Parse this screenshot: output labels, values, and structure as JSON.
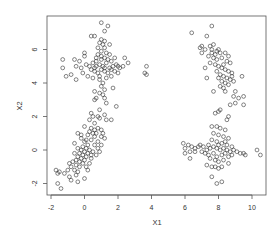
{
  "chart_data": {
    "type": "scatter",
    "title": "",
    "xlabel": "X1",
    "ylabel": "X2",
    "xlim": [
      -2.2,
      10.9
    ],
    "ylim": [
      -2.7,
      7.9
    ],
    "xticks": [
      -2,
      0,
      2,
      4,
      6,
      8,
      10
    ],
    "yticks": [
      -2,
      0,
      2,
      4,
      6
    ],
    "grid": false,
    "legend": null,
    "marker": "open-circle",
    "marker_color": "#333333",
    "series": [
      {
        "name": "cluster-top-left",
        "points": [
          [
            1.0,
            7.6
          ],
          [
            1.4,
            7.4
          ],
          [
            1.2,
            7.1
          ],
          [
            0.4,
            6.8
          ],
          [
            0.6,
            6.8
          ],
          [
            1.0,
            6.6
          ],
          [
            1.2,
            6.5
          ],
          [
            0.9,
            6.4
          ],
          [
            1.1,
            6.3
          ],
          [
            1.5,
            6.3
          ],
          [
            0.8,
            6.1
          ],
          [
            1.2,
            6.1
          ],
          [
            1.0,
            5.9
          ],
          [
            1.3,
            5.8
          ],
          [
            0.8,
            5.7
          ],
          [
            1.5,
            5.7
          ],
          [
            1.0,
            5.6
          ],
          [
            1.2,
            5.5
          ],
          [
            0.7,
            5.5
          ],
          [
            1.8,
            5.5
          ],
          [
            2.4,
            5.5
          ],
          [
            -1.3,
            5.4
          ],
          [
            -0.6,
            5.4
          ],
          [
            -0.3,
            5.3
          ],
          [
            -0.5,
            5.0
          ],
          [
            -0.2,
            4.9
          ],
          [
            0.1,
            5.1
          ],
          [
            0.3,
            5.0
          ],
          [
            0.5,
            5.2
          ],
          [
            0.7,
            5.0
          ],
          [
            0.9,
            5.1
          ],
          [
            1.1,
            5.0
          ],
          [
            1.3,
            5.2
          ],
          [
            1.5,
            4.9
          ],
          [
            1.7,
            5.0
          ],
          [
            1.9,
            5.1
          ],
          [
            2.1,
            4.9
          ],
          [
            2.3,
            5.0
          ],
          [
            2.6,
            5.2
          ],
          [
            0.4,
            4.8
          ],
          [
            0.6,
            4.7
          ],
          [
            0.8,
            4.6
          ],
          [
            1.0,
            4.8
          ],
          [
            1.2,
            4.7
          ],
          [
            1.4,
            4.6
          ],
          [
            1.6,
            4.8
          ],
          [
            1.8,
            4.7
          ],
          [
            2.0,
            4.6
          ],
          [
            -1.3,
            4.9
          ],
          [
            -1.1,
            4.4
          ],
          [
            -0.8,
            4.5
          ],
          [
            -0.5,
            4.2
          ],
          [
            -0.1,
            4.6
          ],
          [
            0.2,
            4.4
          ],
          [
            0.5,
            4.3
          ],
          [
            0.9,
            4.4
          ],
          [
            1.3,
            4.3
          ],
          [
            1.6,
            4.4
          ],
          [
            0.7,
            5.3
          ],
          [
            1.0,
            5.4
          ],
          [
            1.4,
            5.4
          ],
          [
            0.6,
            4.9
          ],
          [
            1.2,
            4.9
          ],
          [
            1.6,
            5.3
          ],
          [
            0.9,
            4.2
          ],
          [
            1.1,
            4.0
          ],
          [
            1.0,
            3.8
          ],
          [
            1.2,
            3.6
          ],
          [
            0.6,
            3.5
          ],
          [
            0.9,
            3.4
          ],
          [
            1.7,
            3.7
          ],
          [
            1.1,
            3.3
          ],
          [
            1.2,
            3.1
          ],
          [
            0.7,
            3.1
          ],
          [
            0.6,
            3.0
          ],
          [
            1.3,
            2.8
          ],
          [
            1.9,
            2.6
          ],
          [
            0.9,
            2.4
          ],
          [
            1.2,
            2.1
          ],
          [
            0.8,
            2.0
          ],
          [
            1.3,
            1.8
          ],
          [
            1.6,
            1.8
          ],
          [
            3.6,
            4.6
          ],
          [
            3.7,
            4.5
          ],
          [
            3.7,
            5.0
          ],
          [
            0.0,
            5.6
          ],
          [
            0.0,
            5.8
          ],
          [
            2.0,
            5.0
          ]
        ]
      },
      {
        "name": "cluster-bottom-left",
        "points": [
          [
            0.4,
            2.2
          ],
          [
            0.5,
            2.0
          ],
          [
            0.9,
            1.9
          ],
          [
            0.3,
            1.8
          ],
          [
            0.6,
            1.6
          ],
          [
            0.0,
            1.4
          ],
          [
            0.4,
            1.3
          ],
          [
            0.8,
            1.3
          ],
          [
            1.0,
            1.2
          ],
          [
            0.3,
            1.1
          ],
          [
            0.5,
            1.0
          ],
          [
            0.7,
            1.0
          ],
          [
            1.1,
            1.0
          ],
          [
            0.2,
            0.9
          ],
          [
            0.6,
            0.8
          ],
          [
            1.0,
            0.8
          ],
          [
            1.2,
            0.7
          ],
          [
            0.4,
            0.6
          ],
          [
            0.8,
            0.5
          ],
          [
            -0.4,
            1.0
          ],
          [
            -0.2,
            0.9
          ],
          [
            0.0,
            0.5
          ],
          [
            0.2,
            0.3
          ],
          [
            -0.1,
            0.2
          ],
          [
            0.1,
            0.1
          ],
          [
            0.3,
            0.0
          ],
          [
            -0.2,
            0.0
          ],
          [
            0.0,
            -0.1
          ],
          [
            0.2,
            -0.2
          ],
          [
            -0.3,
            -0.2
          ],
          [
            -0.1,
            -0.3
          ],
          [
            0.1,
            -0.4
          ],
          [
            -0.4,
            -0.4
          ],
          [
            -0.2,
            -0.5
          ],
          [
            0.0,
            -0.6
          ],
          [
            -0.5,
            -0.6
          ],
          [
            -0.3,
            -0.7
          ],
          [
            -0.7,
            -0.7
          ],
          [
            -0.1,
            -0.8
          ],
          [
            -0.5,
            -0.9
          ],
          [
            -0.8,
            -1.0
          ],
          [
            -0.3,
            -1.0
          ],
          [
            0.6,
            0.3
          ],
          [
            0.8,
            0.1
          ],
          [
            0.5,
            -0.1
          ],
          [
            0.7,
            -0.3
          ],
          [
            0.4,
            -0.5
          ],
          [
            0.3,
            -0.8
          ],
          [
            0.1,
            -1.0
          ],
          [
            0.2,
            -1.2
          ],
          [
            -0.6,
            0.4
          ],
          [
            -0.4,
            0.1
          ],
          [
            -0.6,
            -0.2
          ],
          [
            -0.9,
            -0.8
          ],
          [
            -1.0,
            -1.2
          ],
          [
            -0.6,
            -1.2
          ],
          [
            -0.4,
            -1.3
          ],
          [
            -1.2,
            -1.4
          ],
          [
            -1.5,
            -1.3
          ],
          [
            -1.7,
            -1.2
          ],
          [
            -1.6,
            -1.4
          ],
          [
            -0.5,
            -1.5
          ],
          [
            -0.8,
            -1.8
          ],
          [
            -0.4,
            -1.9
          ],
          [
            0.0,
            -1.7
          ],
          [
            -1.6,
            -2.0
          ],
          [
            -1.4,
            -2.3
          ],
          [
            -0.9,
            -1.6
          ],
          [
            1.0,
            0.3
          ],
          [
            0.9,
            -0.1
          ],
          [
            0.4,
            -0.3
          ],
          [
            0.1,
            0.6
          ],
          [
            -0.2,
            0.7
          ],
          [
            0.6,
            1.2
          ]
        ]
      },
      {
        "name": "cluster-top-right",
        "points": [
          [
            6.4,
            7.0
          ],
          [
            7.6,
            7.4
          ],
          [
            7.3,
            6.8
          ],
          [
            7.0,
            6.2
          ],
          [
            6.9,
            6.1
          ],
          [
            7.2,
            6.0
          ],
          [
            7.5,
            6.2
          ],
          [
            7.7,
            6.3
          ],
          [
            7.6,
            6.0
          ],
          [
            7.9,
            5.9
          ],
          [
            8.1,
            5.8
          ],
          [
            8.4,
            5.8
          ],
          [
            8.6,
            5.6
          ],
          [
            7.4,
            5.6
          ],
          [
            7.7,
            5.5
          ],
          [
            7.9,
            5.4
          ],
          [
            8.2,
            5.5
          ],
          [
            8.5,
            5.3
          ],
          [
            8.7,
            5.2
          ],
          [
            7.5,
            5.2
          ],
          [
            7.8,
            5.1
          ],
          [
            8.0,
            5.0
          ],
          [
            8.2,
            4.9
          ],
          [
            8.4,
            4.8
          ],
          [
            8.6,
            4.7
          ],
          [
            8.8,
            4.6
          ],
          [
            7.9,
            4.7
          ],
          [
            8.1,
            4.5
          ],
          [
            8.3,
            4.4
          ],
          [
            8.5,
            4.3
          ],
          [
            8.7,
            4.2
          ],
          [
            8.9,
            4.1
          ],
          [
            8.2,
            4.1
          ],
          [
            8.4,
            4.0
          ],
          [
            8.6,
            3.9
          ],
          [
            8.1,
            3.8
          ],
          [
            8.3,
            3.7
          ],
          [
            7.7,
            3.5
          ],
          [
            7.3,
            4.3
          ],
          [
            7.2,
            4.9
          ],
          [
            7.0,
            5.8
          ],
          [
            7.6,
            5.8
          ],
          [
            8.0,
            6.0
          ],
          [
            9.4,
            4.4
          ],
          [
            9.0,
            3.5
          ],
          [
            8.9,
            3.2
          ],
          [
            8.4,
            3.5
          ],
          [
            9.2,
            3.1
          ],
          [
            9.5,
            3.2
          ],
          [
            9.5,
            2.7
          ],
          [
            9.0,
            2.8
          ],
          [
            8.7,
            2.7
          ],
          [
            7.8,
            5.7
          ],
          [
            8.3,
            5.1
          ],
          [
            8.0,
            4.3
          ],
          [
            8.8,
            4.4
          ]
        ]
      },
      {
        "name": "cluster-bottom-right",
        "points": [
          [
            8.1,
            2.4
          ],
          [
            8.0,
            2.3
          ],
          [
            7.8,
            2.2
          ],
          [
            8.6,
            2.0
          ],
          [
            8.5,
            1.8
          ],
          [
            7.6,
            1.4
          ],
          [
            7.9,
            1.4
          ],
          [
            8.1,
            1.3
          ],
          [
            8.4,
            1.2
          ],
          [
            7.7,
            1.0
          ],
          [
            8.0,
            0.9
          ],
          [
            8.3,
            0.8
          ],
          [
            8.6,
            0.7
          ],
          [
            7.6,
            0.6
          ],
          [
            7.9,
            0.5
          ],
          [
            8.2,
            0.4
          ],
          [
            8.5,
            0.3
          ],
          [
            8.8,
            0.2
          ],
          [
            7.4,
            0.3
          ],
          [
            5.9,
            0.4
          ],
          [
            6.2,
            0.3
          ],
          [
            6.4,
            0.2
          ],
          [
            6.6,
            0.1
          ],
          [
            6.9,
            0.3
          ],
          [
            7.1,
            0.2
          ],
          [
            7.3,
            0.0
          ],
          [
            7.5,
            0.1
          ],
          [
            7.7,
            0.2
          ],
          [
            7.9,
            0.1
          ],
          [
            8.1,
            0.0
          ],
          [
            8.3,
            0.1
          ],
          [
            8.5,
            0.0
          ],
          [
            8.7,
            -0.1
          ],
          [
            8.9,
            0.0
          ],
          [
            9.1,
            -0.1
          ],
          [
            9.3,
            -0.2
          ],
          [
            9.5,
            -0.2
          ],
          [
            9.6,
            -0.3
          ],
          [
            6.0,
            -0.2
          ],
          [
            6.3,
            -0.5
          ],
          [
            6.6,
            -0.1
          ],
          [
            7.0,
            -0.1
          ],
          [
            7.2,
            -0.2
          ],
          [
            7.4,
            -0.3
          ],
          [
            7.7,
            -0.2
          ],
          [
            7.9,
            -0.4
          ],
          [
            8.2,
            -0.3
          ],
          [
            8.4,
            -0.2
          ],
          [
            8.6,
            -0.4
          ],
          [
            8.8,
            -0.3
          ],
          [
            7.8,
            -0.6
          ],
          [
            8.0,
            -0.7
          ],
          [
            8.3,
            -0.6
          ],
          [
            8.6,
            -0.8
          ],
          [
            7.3,
            -0.9
          ],
          [
            7.6,
            -1.0
          ],
          [
            7.8,
            -1.0
          ],
          [
            8.0,
            -1.1
          ],
          [
            8.2,
            -1.0
          ],
          [
            7.6,
            -1.6
          ],
          [
            8.2,
            -1.9
          ],
          [
            7.9,
            -2.0
          ],
          [
            10.3,
            0.0
          ],
          [
            10.5,
            -0.3
          ],
          [
            6.0,
            0.1
          ],
          [
            6.3,
            -0.1
          ],
          [
            8.0,
            0.3
          ],
          [
            8.4,
            0.5
          ],
          [
            7.5,
            -0.5
          ],
          [
            6.8,
            0.2
          ]
        ]
      }
    ]
  }
}
